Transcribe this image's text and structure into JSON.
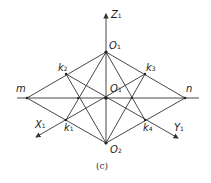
{
  "diagram": {
    "caption": "(c)",
    "points": {
      "O_top": {
        "label": "O",
        "sub": "1",
        "x": 106,
        "y": 52
      },
      "O_center": {
        "label": "O",
        "sub": "1",
        "x": 106,
        "y": 98
      },
      "O_bottom": {
        "label": "O",
        "sub": "2",
        "x": 106,
        "y": 143
      },
      "m": {
        "label": "m",
        "x": 27,
        "y": 98
      },
      "n": {
        "label": "n",
        "x": 185,
        "y": 98
      },
      "k1": {
        "label": "k",
        "sub": "1",
        "x": 66,
        "y": 120
      },
      "k2": {
        "label": "k",
        "sub": "2",
        "x": 66,
        "y": 74
      },
      "k3": {
        "label": "k",
        "sub": "3",
        "x": 145,
        "y": 74
      },
      "k4": {
        "label": "k",
        "sub": "4",
        "x": 145,
        "y": 120
      }
    },
    "axes": {
      "z": {
        "label": "Z",
        "sub": "1"
      },
      "x": {
        "label": "X",
        "sub": "1"
      },
      "y": {
        "label": "Y",
        "sub": "1"
      }
    },
    "line_color": "#333333"
  }
}
